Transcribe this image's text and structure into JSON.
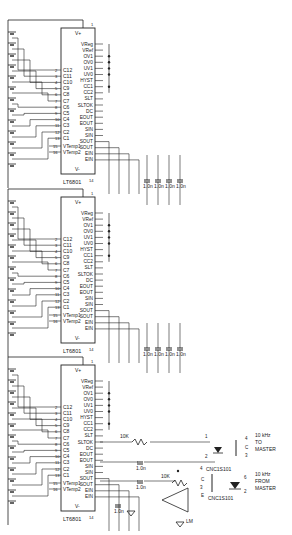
{
  "schematic": {
    "chips": [
      {
        "part": "LT6801",
        "top_pin": "1",
        "bottom_pin": "14",
        "supply_top": "V+",
        "supply_bottom": "V-"
      },
      {
        "part": "LT6801",
        "top_pin": "1",
        "bottom_pin": "14",
        "supply_top": "V+",
        "supply_bottom": "V-"
      },
      {
        "part": "LT6801",
        "top_pin": "1",
        "bottom_pin": "14",
        "supply_top": "V+",
        "supply_bottom": "V-"
      }
    ],
    "left_pins": [
      "C12",
      "C11",
      "C10",
      "C9",
      "C8",
      "C7",
      "C6",
      "C5",
      "C4",
      "C3",
      "C2",
      "C1"
    ],
    "left_pin_numbers": [
      "2",
      "3",
      "4",
      "5",
      "6",
      "7",
      "8",
      "9",
      "10",
      "11",
      "12",
      "13"
    ],
    "temp_pins": [
      "VTemp1",
      "VTemp2"
    ],
    "temp_pin_numbers": [
      "15",
      "16"
    ],
    "right_pins": [
      "VReg",
      "VRef",
      "OV1",
      "OV0",
      "UV1",
      "UV0",
      "HYST",
      "CC1",
      "CC2",
      "SLT",
      "SLTOK",
      "DC",
      "EOUT",
      "EOUT",
      "SIN",
      "SIN",
      "SOUT",
      "SOUT",
      "EIN",
      "EIN"
    ],
    "capacitor_label": "1.0n",
    "resistor_label": "10K",
    "optocouplers": [
      {
        "part": "CNC1S101",
        "pins": [
          "1",
          "2",
          "4",
          "3"
        ],
        "pin_labels": [
          "C",
          "E"
        ],
        "signal": "10 kHz",
        "signal2": "TO",
        "signal3": "MASTER"
      },
      {
        "part": "CNC1S101",
        "pins": [
          "4",
          "3",
          "6",
          "2"
        ],
        "pin_labels": [
          "C",
          "E"
        ],
        "signal": "10 kHz",
        "signal2": "FROM",
        "signal3": "MASTER"
      }
    ],
    "comparator": {
      "label": "LM",
      "pins": [
        "7",
        "6",
        "8",
        "5",
        "4"
      ]
    }
  }
}
